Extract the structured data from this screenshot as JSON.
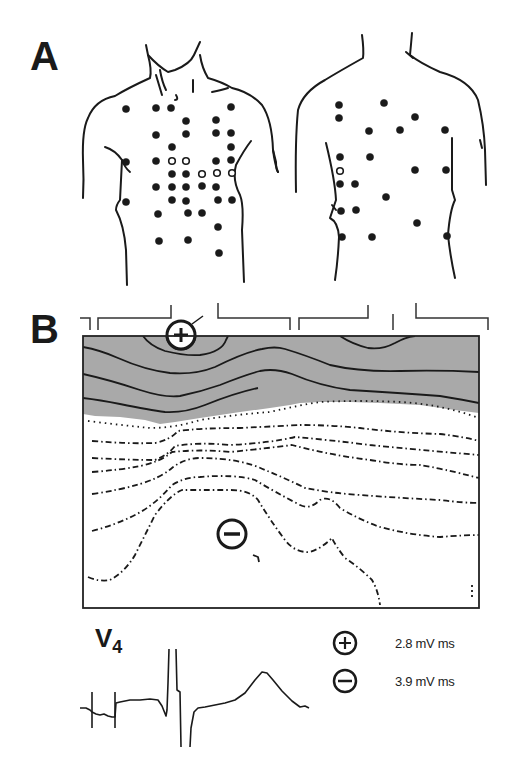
{
  "figure": {
    "panel_a": {
      "label": "A",
      "views": [
        "anterior-torso",
        "posterior-torso"
      ],
      "anterior_electrodes_filled": [
        [
          126,
          109
        ],
        [
          156,
          108
        ],
        [
          171,
          108
        ],
        [
          231,
          107
        ],
        [
          186,
          121
        ],
        [
          216,
          120
        ],
        [
          156,
          135
        ],
        [
          186,
          134
        ],
        [
          216,
          133
        ],
        [
          231,
          133
        ],
        [
          172,
          147
        ],
        [
          231,
          147
        ],
        [
          126,
          162
        ],
        [
          156,
          161
        ],
        [
          216,
          161
        ],
        [
          231,
          160
        ],
        [
          172,
          174
        ],
        [
          186,
          174
        ],
        [
          156,
          187
        ],
        [
          172,
          187
        ],
        [
          186,
          187
        ],
        [
          202,
          186
        ],
        [
          216,
          187
        ],
        [
          126,
          202
        ],
        [
          172,
          200
        ],
        [
          186,
          201
        ],
        [
          218,
          200
        ],
        [
          232,
          200
        ],
        [
          158,
          214
        ],
        [
          188,
          213
        ],
        [
          202,
          213
        ],
        [
          218,
          227
        ],
        [
          159,
          241
        ],
        [
          188,
          240
        ],
        [
          219,
          253
        ]
      ],
      "anterior_electrodes_open": [
        [
          172,
          161
        ],
        [
          186,
          161
        ],
        [
          202,
          174
        ],
        [
          217,
          173
        ],
        [
          232,
          173
        ]
      ],
      "posterior_electrodes_filled": [
        [
          339,
          105
        ],
        [
          384,
          103
        ],
        [
          339,
          118
        ],
        [
          415,
          117
        ],
        [
          369,
          131
        ],
        [
          400,
          130
        ],
        [
          445,
          130
        ],
        [
          340,
          157
        ],
        [
          370,
          157
        ],
        [
          340,
          184
        ],
        [
          355,
          184
        ],
        [
          415,
          170
        ],
        [
          446,
          170
        ],
        [
          386,
          197
        ],
        [
          341,
          211
        ],
        [
          356,
          210
        ],
        [
          417,
          223
        ],
        [
          342,
          237
        ],
        [
          372,
          237
        ],
        [
          447,
          236
        ]
      ],
      "posterior_electrodes_open": [
        [
          340,
          171
        ]
      ]
    },
    "panel_b": {
      "label": "B",
      "type": "isointegral-map",
      "positive_marker": "+",
      "negative_marker": "−",
      "colors": {
        "positive_region": "#aaaaaa",
        "contour": "#1a1a1a",
        "frame": "#222222"
      }
    },
    "trace": {
      "lead": "V",
      "lead_sub": "4"
    },
    "legend": [
      {
        "symbol": "plus-circle",
        "value": "2.8 mV ms"
      },
      {
        "symbol": "minus-circle",
        "value": "3.9 mV ms"
      }
    ]
  }
}
